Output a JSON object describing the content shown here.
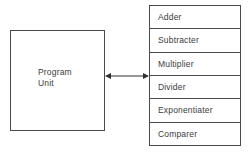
{
  "diagram": {
    "background_color": "#ffffff",
    "line_color": "#4a4a4a",
    "text_color": "#3b3b3b",
    "program_unit": {
      "label": "Program\nUnit"
    },
    "connector": {
      "type": "double-headed-arrow",
      "direction": "bidirectional",
      "label": ""
    },
    "unit_stack": {
      "rows": [
        {
          "label": "Adder"
        },
        {
          "label": "Subtracter"
        },
        {
          "label": "Multiplier"
        },
        {
          "label": "Divider"
        },
        {
          "label": "Exponentiater"
        },
        {
          "label": "Comparer"
        }
      ]
    }
  }
}
